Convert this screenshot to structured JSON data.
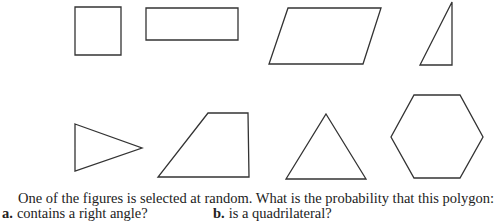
{
  "figures": [
    {
      "name": "square",
      "points": "75,7 121,7 121,55 75,55"
    },
    {
      "name": "rectangle",
      "points": "146,8 238,8 238,40 146,40"
    },
    {
      "name": "parallelogram",
      "points": "288,8 381,8 363,64 269,64"
    },
    {
      "name": "right-triangle",
      "points": "452,2 452,65 420,65"
    },
    {
      "name": "triangle-pointing-right",
      "points": "75,124 142,148 75,171"
    },
    {
      "name": "trapezoid",
      "points": "208,113 248,113 249,177 158,177"
    },
    {
      "name": "equilateral-triangle",
      "points": "326,114 366,179 286,179"
    },
    {
      "name": "hexagon",
      "points": "414,95 460,95 483,137 460,178 414,178 391,137"
    }
  ],
  "question": "One of the figures is selected at random. What is the probability that this polygon:",
  "parts": [
    {
      "label": "a.",
      "text": "contains a right angle?"
    },
    {
      "label": "b.",
      "text": "is a quadrilateral?"
    }
  ]
}
